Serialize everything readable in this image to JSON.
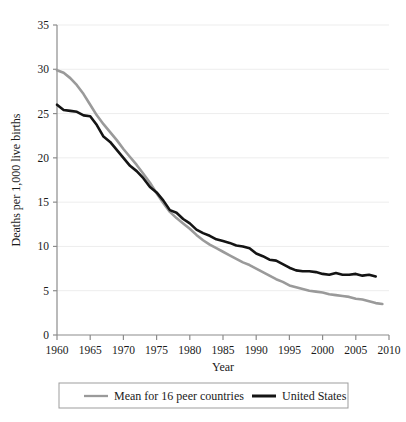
{
  "chart_data": {
    "type": "line",
    "title": "",
    "xlabel": "Year",
    "ylabel": "Deaths per 1,000 live births",
    "xlim": [
      1960,
      2010
    ],
    "ylim": [
      0,
      35
    ],
    "xticks": [
      1960,
      1965,
      1970,
      1975,
      1980,
      1985,
      1990,
      1995,
      2000,
      2005,
      2010
    ],
    "yticks": [
      0,
      5,
      10,
      15,
      20,
      25,
      30,
      35
    ],
    "grid": "horizontal",
    "legend_position": "below",
    "series": [
      {
        "name": "Mean for 16 peer countries",
        "color": "#9a9a9a",
        "x": [
          1960,
          1961,
          1962,
          1963,
          1964,
          1965,
          1966,
          1967,
          1968,
          1969,
          1970,
          1971,
          1972,
          1973,
          1974,
          1975,
          1976,
          1977,
          1978,
          1979,
          1980,
          1981,
          1982,
          1983,
          1984,
          1985,
          1986,
          1987,
          1988,
          1989,
          1990,
          1991,
          1992,
          1993,
          1994,
          1995,
          1996,
          1997,
          1998,
          1999,
          2000,
          2001,
          2002,
          2003,
          2004,
          2005,
          2006,
          2007,
          2008,
          2009
        ],
        "values": [
          29.9,
          29.6,
          29.0,
          28.2,
          27.2,
          26.0,
          24.8,
          23.8,
          22.9,
          22.0,
          21.0,
          20.1,
          19.2,
          18.2,
          17.2,
          16.0,
          14.9,
          13.9,
          13.2,
          12.6,
          12.0,
          11.3,
          10.7,
          10.2,
          9.8,
          9.4,
          9.0,
          8.6,
          8.2,
          7.9,
          7.5,
          7.1,
          6.7,
          6.3,
          6.0,
          5.6,
          5.4,
          5.2,
          5.0,
          4.9,
          4.8,
          4.6,
          4.5,
          4.4,
          4.3,
          4.1,
          4.0,
          3.8,
          3.6,
          3.5
        ]
      },
      {
        "name": "United States",
        "color": "#141414",
        "x": [
          1960,
          1961,
          1962,
          1963,
          1964,
          1965,
          1966,
          1967,
          1968,
          1969,
          1970,
          1971,
          1972,
          1973,
          1974,
          1975,
          1976,
          1977,
          1978,
          1979,
          1980,
          1981,
          1982,
          1983,
          1984,
          1985,
          1986,
          1987,
          1988,
          1989,
          1990,
          1991,
          1992,
          1993,
          1994,
          1995,
          1996,
          1997,
          1998,
          1999,
          2000,
          2001,
          2002,
          2003,
          2004,
          2005,
          2006,
          2007,
          2008
        ],
        "values": [
          26.0,
          25.4,
          25.3,
          25.2,
          24.8,
          24.7,
          23.7,
          22.4,
          21.8,
          20.9,
          20.0,
          19.1,
          18.5,
          17.7,
          16.7,
          16.1,
          15.2,
          14.1,
          13.8,
          13.1,
          12.6,
          11.9,
          11.5,
          11.2,
          10.8,
          10.6,
          10.4,
          10.1,
          10.0,
          9.8,
          9.2,
          8.9,
          8.5,
          8.4,
          8.0,
          7.6,
          7.3,
          7.2,
          7.2,
          7.1,
          6.9,
          6.8,
          7.0,
          6.8,
          6.8,
          6.9,
          6.7,
          6.8,
          6.6
        ]
      }
    ]
  },
  "axes": {
    "y_title": "Deaths per 1,000 live births",
    "x_title": "Year",
    "y_tick_labels": [
      "35",
      "30",
      "25",
      "20",
      "15",
      "10",
      "5",
      "0"
    ],
    "x_tick_labels": [
      "1960",
      "1965",
      "1970",
      "1975",
      "1980",
      "1985",
      "1990",
      "1995",
      "2000",
      "2005",
      "2010"
    ]
  },
  "legend": {
    "entries": [
      {
        "label": "Mean for 16 peer countries",
        "color": "#9a9a9a"
      },
      {
        "label": "United States",
        "color": "#141414"
      }
    ]
  },
  "colors": {
    "peer_line": "#9a9a9a",
    "us_line": "#141414",
    "axis": "#8c8c8c",
    "gridline": "#ededed",
    "legend_border": "#9d9d9d",
    "background": "#ffffff"
  }
}
